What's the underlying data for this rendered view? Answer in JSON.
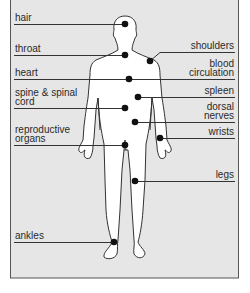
{
  "diagram": {
    "background": "#e6e6e6",
    "border_color": "#555555",
    "labels": {
      "hair": "hair",
      "throat": "throat",
      "heart": "heart",
      "spine_1": "spine & spinal",
      "spine_2": "cord",
      "reproductive_1": "reproductive",
      "reproductive_2": "organs",
      "ankles": "ankles",
      "shoulders": "shoulders",
      "blood_1": "blood",
      "blood_2": "circulation",
      "spleen": "spleen",
      "dorsal_1": "dorsal",
      "dorsal_2": "nerves",
      "wrists": "wrists",
      "legs": "legs"
    }
  }
}
